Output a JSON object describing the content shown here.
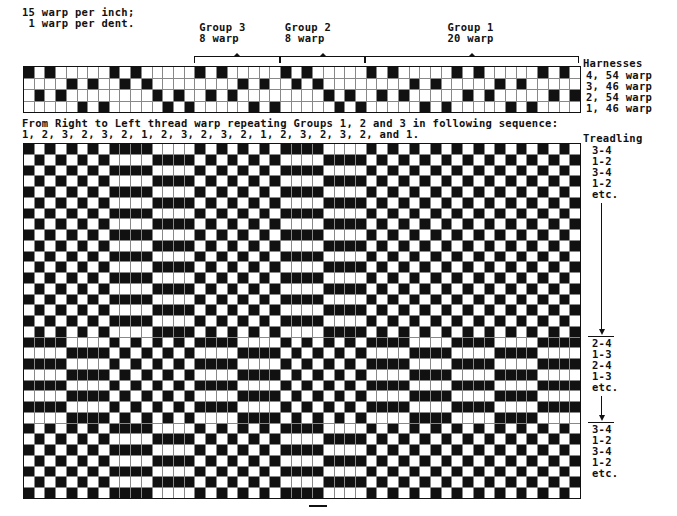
{
  "header": {
    "density_line1": "15 warp per inch;",
    "density_line2": " 1 warp per dent."
  },
  "groups": [
    {
      "id": "group3",
      "title": "Group 3",
      "count": "8 warp",
      "start_col": 17,
      "end_col": 24
    },
    {
      "id": "group2",
      "title": "Group 2",
      "count": "8 warp",
      "start_col": 25,
      "end_col": 32
    },
    {
      "id": "group1",
      "title": "Group 1",
      "count": "20 warp",
      "start_col": 33,
      "end_col": 52
    }
  ],
  "harnesses": {
    "title": "Harnesses",
    "rows": [
      {
        "harness": 4,
        "label": "4, 54 warp"
      },
      {
        "harness": 3,
        "label": "3, 46 warp"
      },
      {
        "harness": 2,
        "label": "2, 54 warp"
      },
      {
        "harness": 1,
        "label": "1, 46 warp"
      }
    ]
  },
  "threading": [
    4,
    2,
    4,
    2,
    3,
    1,
    3,
    1,
    4,
    3,
    4,
    3,
    2,
    1,
    2,
    1,
    4,
    2,
    4,
    2,
    3,
    1,
    3,
    1,
    4,
    3,
    4,
    3,
    2,
    1,
    2,
    1,
    4,
    2,
    4,
    2,
    3,
    1,
    3,
    1,
    4,
    2,
    4,
    2,
    3,
    1,
    3,
    1,
    4,
    2,
    4,
    2
  ],
  "instructions": {
    "line1": "From Right to Left thread warp repeating Groups 1, 2 and 3 in following sequence:",
    "line2": "1, 2, 3, 2, 3, 2, 1, 2, 3, 2, 3, 2, 1, 2, 3, 2, 3, 2, and 1."
  },
  "treadling": {
    "title": "Treadling",
    "sections": [
      {
        "rows": 18,
        "lifts": [
          [
            3,
            4
          ],
          [
            1,
            2
          ]
        ],
        "labels": [
          "3-4",
          "1-2",
          "3-4",
          "1-2",
          "etc."
        ]
      },
      {
        "rows": 8,
        "lifts": [
          [
            2,
            4
          ],
          [
            1,
            3
          ]
        ],
        "labels": [
          "2-4",
          "1-3",
          "2-4",
          "1-3",
          "etc."
        ]
      },
      {
        "rows": 7,
        "lifts": [
          [
            3,
            4
          ],
          [
            1,
            2
          ]
        ],
        "labels": [
          "3-4",
          "1-2",
          "3-4",
          "1-2",
          "etc."
        ]
      }
    ]
  },
  "colors": {
    "ink": "#111111",
    "paper": "#ffffff",
    "gridline": "#888888"
  }
}
